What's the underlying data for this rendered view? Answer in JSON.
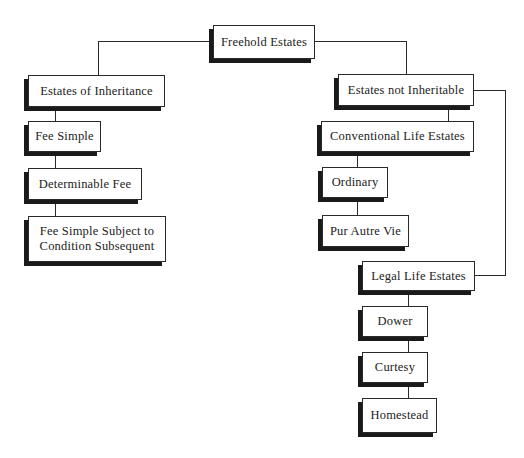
{
  "diagram": {
    "title": "Freehold Estates",
    "root": {
      "id": "freehold",
      "label": "Freehold Estates"
    },
    "nodes": [
      {
        "id": "freehold",
        "label": "Freehold Estates"
      },
      {
        "id": "inheritance",
        "label": "Estates of Inheritance"
      },
      {
        "id": "fee-simple",
        "label": "Fee Simple"
      },
      {
        "id": "determinable-fee",
        "label": "Determinable Fee"
      },
      {
        "id": "fee-simple-subject",
        "label": "Fee Simple Subject to\nCondition Subsequent"
      },
      {
        "id": "not-inheritable",
        "label": "Estates not Inheritable"
      },
      {
        "id": "conventional",
        "label": "Conventional Life Estates"
      },
      {
        "id": "ordinary",
        "label": "Ordinary"
      },
      {
        "id": "pur-autre-vie",
        "label": "Pur Autre Vie"
      },
      {
        "id": "legal-life",
        "label": "Legal Life Estates"
      },
      {
        "id": "dower",
        "label": "Dower"
      },
      {
        "id": "curtesy",
        "label": "Curtesy"
      },
      {
        "id": "homestead",
        "label": "Homestead"
      }
    ],
    "edges": [
      [
        "freehold",
        "inheritance"
      ],
      [
        "freehold",
        "not-inheritable"
      ],
      [
        "inheritance",
        "fee-simple"
      ],
      [
        "inheritance",
        "determinable-fee"
      ],
      [
        "inheritance",
        "fee-simple-subject"
      ],
      [
        "not-inheritable",
        "conventional"
      ],
      [
        "not-inheritable",
        "legal-life"
      ],
      [
        "conventional",
        "ordinary"
      ],
      [
        "conventional",
        "pur-autre-vie"
      ],
      [
        "legal-life",
        "dower"
      ],
      [
        "legal-life",
        "curtesy"
      ],
      [
        "legal-life",
        "homestead"
      ]
    ]
  }
}
